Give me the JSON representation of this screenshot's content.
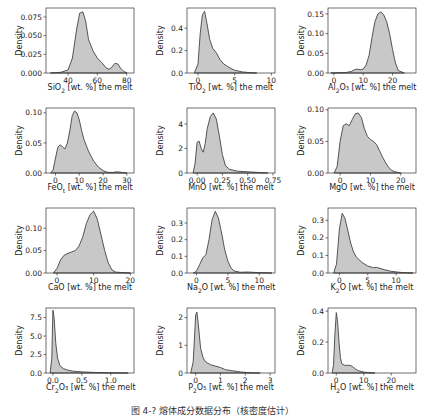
{
  "figure": {
    "caption": "图 4-? 熔体成分数据分布（核密度估计）",
    "fill_color": "#c8c8c8",
    "line_color": "#444444",
    "ylabel": "Density"
  },
  "chart_data": [
    {
      "type": "area",
      "name": "SiO2",
      "xlabel_main": "SiO",
      "xlabel_sub": "2",
      "xlabel_rest": " [wt. %] the melt",
      "xlim": [
        25,
        85
      ],
      "ylim": [
        0,
        0.087
      ],
      "xticks": [
        40,
        60,
        80
      ],
      "yticks": [
        0,
        0.025,
        0.05,
        0.075
      ],
      "ytick_labels": [
        "0.000",
        "0.025",
        "0.050",
        "0.075"
      ],
      "x": [
        28,
        35,
        40,
        43,
        46,
        48,
        50,
        52,
        54,
        57,
        60,
        63,
        66,
        68,
        70,
        72,
        74,
        76,
        78,
        80
      ],
      "y": [
        0,
        0.001,
        0.004,
        0.02,
        0.06,
        0.08,
        0.082,
        0.07,
        0.045,
        0.03,
        0.02,
        0.014,
        0.007,
        0.005,
        0.008,
        0.013,
        0.012,
        0.006,
        0.002,
        0.0005
      ]
    },
    {
      "type": "area",
      "name": "TiO2",
      "xlabel_main": "TiO",
      "xlabel_sub": "2",
      "xlabel_rest": " [wt. %] the melt",
      "xlim": [
        -1.5,
        10.5
      ],
      "ylim": [
        0,
        0.58
      ],
      "xticks": [
        0,
        5,
        10
      ],
      "yticks": [
        0,
        0.2,
        0.4
      ],
      "ytick_labels": [
        "0.0",
        "0.2",
        "0.4"
      ],
      "x": [
        -0.5,
        0,
        0.3,
        0.6,
        0.9,
        1.2,
        1.6,
        2,
        2.5,
        3,
        3.5,
        4,
        4.5,
        5,
        6,
        7,
        8
      ],
      "y": [
        0,
        0.08,
        0.35,
        0.52,
        0.55,
        0.45,
        0.3,
        0.22,
        0.18,
        0.12,
        0.08,
        0.06,
        0.04,
        0.025,
        0.01,
        0.004,
        0
      ]
    },
    {
      "type": "area",
      "name": "Al2O3",
      "xlabel_main": "Al",
      "xlabel_sub": "2",
      "xlabel_rest": "O₃ [wt. %] the melt",
      "xlim": [
        -2,
        28
      ],
      "ylim": [
        0,
        0.165
      ],
      "xticks": [
        0,
        10,
        20
      ],
      "yticks": [
        0,
        0.05,
        0.1,
        0.15
      ],
      "ytick_labels": [
        "0.00",
        "0.05",
        "0.10",
        "0.15"
      ],
      "x": [
        -1,
        4,
        6,
        7,
        8,
        9,
        10,
        11,
        12,
        13,
        14,
        15,
        16,
        17,
        18,
        19,
        20,
        21,
        22,
        24
      ],
      "y": [
        0,
        0.001,
        0.004,
        0.008,
        0.01,
        0.008,
        0.01,
        0.02,
        0.045,
        0.09,
        0.13,
        0.15,
        0.155,
        0.148,
        0.13,
        0.1,
        0.06,
        0.025,
        0.006,
        0
      ]
    },
    {
      "type": "area",
      "name": "FeOt",
      "xlabel_main": "FeO",
      "xlabel_sub": "t",
      "xlabel_rest": " [wt. %] the melt",
      "xlim": [
        -4,
        33
      ],
      "ylim": [
        0,
        0.108
      ],
      "xticks": [
        0,
        10,
        20,
        30
      ],
      "yticks": [
        0,
        0.05,
        0.1
      ],
      "ytick_labels": [
        "0.00",
        "0.05",
        "0.10"
      ],
      "x": [
        -2,
        -1,
        0,
        1,
        2,
        3,
        4,
        5,
        6,
        7,
        8,
        9,
        10,
        11,
        12,
        14,
        16,
        18,
        20,
        22,
        24,
        26,
        28,
        30
      ],
      "y": [
        0,
        0.005,
        0.025,
        0.043,
        0.047,
        0.043,
        0.04,
        0.05,
        0.07,
        0.095,
        0.103,
        0.1,
        0.088,
        0.07,
        0.055,
        0.035,
        0.02,
        0.01,
        0.004,
        0.001,
        0.001,
        0.002,
        0.001,
        0
      ]
    },
    {
      "type": "area",
      "name": "MnO",
      "xlabel_main": "MnO",
      "xlabel_sub": "",
      "xlabel_rest": " [wt. %] the melt",
      "xlim": [
        -0.1,
        0.77
      ],
      "ylim": [
        0,
        5.3
      ],
      "xticks": [
        0,
        0.25,
        0.5,
        0.75
      ],
      "xtick_labels": [
        "0.00",
        "0.25",
        "0.50",
        "0.75"
      ],
      "yticks": [
        0,
        2,
        4
      ],
      "ytick_labels": [
        "0",
        "2",
        "4"
      ],
      "x": [
        -0.04,
        -0.02,
        0,
        0.02,
        0.04,
        0.06,
        0.08,
        0.1,
        0.13,
        0.16,
        0.19,
        0.22,
        0.25,
        0.28,
        0.32,
        0.4,
        0.5,
        0.6,
        0.7
      ],
      "y": [
        0,
        0.8,
        2.5,
        2.6,
        2,
        1.7,
        2.4,
        3.6,
        4.6,
        4.9,
        4.4,
        3,
        1.5,
        0.6,
        0.3,
        0.15,
        0.1,
        0.05,
        0
      ]
    },
    {
      "type": "area",
      "name": "MgO",
      "xlabel_main": "MgO",
      "xlabel_sub": "",
      "xlabel_rest": " [wt. %] the melt",
      "xlim": [
        -4,
        25
      ],
      "ylim": [
        0,
        0.103
      ],
      "xticks": [
        0,
        10,
        20
      ],
      "yticks": [
        0,
        0.05,
        0.1
      ],
      "ytick_labels": [
        "0.00",
        "0.05",
        "0.10"
      ],
      "x": [
        -2,
        -1,
        0,
        1,
        2,
        3,
        4,
        5,
        6,
        7,
        8,
        9,
        10,
        11,
        12,
        13,
        14,
        15,
        16,
        17,
        18,
        19,
        20
      ],
      "y": [
        0,
        0.01,
        0.05,
        0.075,
        0.078,
        0.075,
        0.085,
        0.094,
        0.095,
        0.088,
        0.07,
        0.058,
        0.053,
        0.05,
        0.045,
        0.035,
        0.025,
        0.016,
        0.009,
        0.004,
        0.002,
        0.001,
        0
      ]
    },
    {
      "type": "area",
      "name": "CaO",
      "xlabel_main": "CaO",
      "xlabel_sub": "",
      "xlabel_rest": " [wt. %] the melt",
      "xlim": [
        -3,
        21
      ],
      "ylim": [
        0,
        0.145
      ],
      "xticks": [
        0,
        10,
        20
      ],
      "yticks": [
        0,
        0.05,
        0.1
      ],
      "ytick_labels": [
        "0.00",
        "0.05",
        "0.10"
      ],
      "x": [
        -1,
        0,
        1,
        2,
        3,
        4,
        5,
        6,
        7,
        8,
        9,
        10,
        11,
        12,
        13,
        14,
        15,
        16,
        18,
        20
      ],
      "y": [
        0,
        0.01,
        0.03,
        0.04,
        0.044,
        0.047,
        0.05,
        0.06,
        0.08,
        0.11,
        0.13,
        0.138,
        0.12,
        0.085,
        0.05,
        0.022,
        0.007,
        0.002,
        0.001,
        0
      ]
    },
    {
      "type": "area",
      "name": "Na2O",
      "xlabel_main": "Na",
      "xlabel_sub": "2",
      "xlabel_rest": "O [wt. %] the melt",
      "xlim": [
        -1.5,
        12.5
      ],
      "ylim": [
        0,
        0.39
      ],
      "xticks": [
        0,
        5,
        10
      ],
      "yticks": [
        0,
        0.1,
        0.2,
        0.3
      ],
      "ytick_labels": [
        "0.0",
        "0.1",
        "0.2",
        "0.3"
      ],
      "x": [
        -0.5,
        0,
        0.5,
        1,
        1.5,
        2,
        2.5,
        3,
        3.5,
        4,
        4.5,
        5,
        5.5,
        6,
        7,
        8,
        9,
        10,
        11,
        12
      ],
      "y": [
        0,
        0.01,
        0.05,
        0.09,
        0.11,
        0.2,
        0.32,
        0.37,
        0.33,
        0.24,
        0.14,
        0.07,
        0.03,
        0.012,
        0.004,
        0.006,
        0.004,
        0.002,
        0.001,
        0
      ]
    },
    {
      "type": "area",
      "name": "K2O",
      "xlabel_main": "K",
      "xlabel_sub": "2",
      "xlabel_rest": "O [wt. %] the melt",
      "xlim": [
        -2,
        13.5
      ],
      "ylim": [
        0,
        0.37
      ],
      "xticks": [
        0,
        5,
        10
      ],
      "yticks": [
        0,
        0.1,
        0.2,
        0.3
      ],
      "ytick_labels": [
        "0.0",
        "0.1",
        "0.2",
        "0.3"
      ],
      "x": [
        -1,
        -0.5,
        0,
        0.5,
        1,
        1.5,
        2,
        2.5,
        3,
        4,
        5,
        6,
        6.5,
        7,
        8,
        9,
        10,
        11,
        12,
        13
      ],
      "y": [
        0,
        0.05,
        0.25,
        0.34,
        0.31,
        0.24,
        0.17,
        0.12,
        0.09,
        0.06,
        0.04,
        0.03,
        0.032,
        0.028,
        0.018,
        0.01,
        0.006,
        0.003,
        0.001,
        0
      ]
    },
    {
      "type": "area",
      "name": "Cr2O3",
      "xlabel_main": "Cr",
      "xlabel_sub": "2",
      "xlabel_rest": "O₃ [wt. %] the melt",
      "xlim": [
        -0.12,
        1.4
      ],
      "ylim": [
        0,
        8.8
      ],
      "xticks": [
        0,
        0.5,
        1
      ],
      "xtick_labels": [
        "0.0",
        "0.5",
        "1.0"
      ],
      "yticks": [
        0,
        2.5,
        5,
        7.5
      ],
      "ytick_labels": [
        "0.0",
        "2.5",
        "5.0",
        "7.5"
      ],
      "x": [
        -0.05,
        -0.02,
        0,
        0.02,
        0.05,
        0.08,
        0.12,
        0.18,
        0.25,
        0.35,
        0.5,
        0.7,
        0.9,
        1.1,
        1.3
      ],
      "y": [
        0,
        2,
        8.5,
        7.5,
        4,
        2,
        1,
        0.6,
        0.4,
        0.25,
        0.15,
        0.08,
        0.04,
        0.02,
        0
      ]
    },
    {
      "type": "area",
      "name": "P2O5",
      "xlabel_main": "P",
      "xlabel_sub": "2",
      "xlabel_rest": "O₅ [wt. %] the melt",
      "xlim": [
        -0.35,
        3.2
      ],
      "ylim": [
        0,
        2.35
      ],
      "xticks": [
        0,
        1,
        2,
        3
      ],
      "yticks": [
        0,
        1,
        2
      ],
      "ytick_labels": [
        "0",
        "1",
        "2"
      ],
      "x": [
        -0.2,
        -0.1,
        0,
        0.05,
        0.1,
        0.2,
        0.3,
        0.4,
        0.6,
        0.8,
        1,
        1.2,
        1.5,
        1.8,
        2,
        2.3,
        2.6
      ],
      "y": [
        0,
        0.4,
        2.1,
        2.2,
        1.8,
        0.9,
        0.55,
        0.4,
        0.3,
        0.25,
        0.2,
        0.12,
        0.08,
        0.04,
        0.02,
        0.005,
        0
      ]
    },
    {
      "type": "area",
      "name": "H2O",
      "xlabel_main": "H",
      "xlabel_sub": "2",
      "xlabel_rest": "O [wt. %] the melt",
      "xlim": [
        -3,
        29
      ],
      "ylim": [
        0,
        0.42
      ],
      "xticks": [
        0,
        10,
        20
      ],
      "yticks": [
        0,
        0.2,
        0.4
      ],
      "ytick_labels": [
        "0.0",
        "0.2",
        "0.4"
      ],
      "x": [
        -1.5,
        -1,
        -0.5,
        0,
        0.5,
        1,
        1.5,
        2,
        3,
        4,
        5,
        6,
        7,
        8,
        10,
        12,
        14
      ],
      "y": [
        0,
        0.05,
        0.25,
        0.39,
        0.33,
        0.2,
        0.1,
        0.06,
        0.05,
        0.05,
        0.05,
        0.04,
        0.025,
        0.015,
        0.006,
        0.002,
        0
      ]
    }
  ]
}
